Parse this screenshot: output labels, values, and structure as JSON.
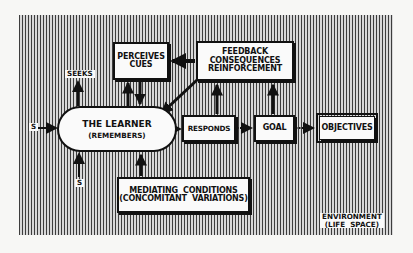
{
  "diagram": {
    "nodes": {
      "learner": {
        "line1": "THE LEARNER",
        "line2": "(REMEMBERS)"
      },
      "perceives": {
        "line1": "PERCEIVES",
        "line2": "CUES"
      },
      "feedback": {
        "line1": "FEEDBACK",
        "line2": "CONSEQUENCES",
        "line3": "REINFORCEMENT"
      },
      "responds": {
        "label": "RESPONDS"
      },
      "goal": {
        "label": "GOAL"
      },
      "objectives": {
        "label": "OBJECTIVES"
      },
      "mediating": {
        "line1": "MEDIATING  CONDITIONS",
        "line2": "(CONCOMITANT  VARIATIONS)"
      }
    },
    "labels": {
      "seeks": "SEEKS",
      "stimulus_left": "S",
      "stimulus_bottom": "S",
      "environment_line1": "ENVIRONMENT",
      "environment_line2": "(LIFE  SPACE)"
    },
    "edges": [
      {
        "from": "stimulus_left",
        "to": "learner",
        "style": "solid"
      },
      {
        "from": "stimulus_bottom",
        "to": "learner",
        "style": "solid"
      },
      {
        "from": "learner",
        "to": "seeks",
        "style": "solid"
      },
      {
        "from": "learner",
        "to": "perceives",
        "style": "solid"
      },
      {
        "from": "perceives",
        "to": "learner",
        "style": "solid"
      },
      {
        "from": "feedback",
        "to": "perceives",
        "style": "solid"
      },
      {
        "from": "feedback",
        "to": "learner",
        "style": "solid"
      },
      {
        "from": "learner",
        "to": "responds",
        "style": "solid"
      },
      {
        "from": "responds",
        "to": "feedback",
        "style": "solid"
      },
      {
        "from": "goal",
        "to": "feedback",
        "style": "solid"
      },
      {
        "from": "responds",
        "to": "goal",
        "style": "dotted"
      },
      {
        "from": "goal",
        "to": "objectives",
        "style": "dotted"
      },
      {
        "from": "mediating",
        "to": "learner",
        "style": "solid"
      }
    ]
  }
}
